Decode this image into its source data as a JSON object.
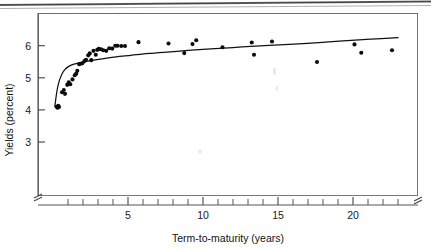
{
  "figure": {
    "alt_title": "Yields versus term-to-maturity scatter plot with fitted curve"
  },
  "chart_data": {
    "type": "scatter",
    "title": "",
    "xlabel": "Term-to-maturity (years)",
    "ylabel": "Yields (percent)",
    "xlim": [
      0,
      23.2
    ],
    "ylim": [
      2.55,
      6.55
    ],
    "xticks": [
      5,
      10,
      15,
      20
    ],
    "xtick_labels": [
      "5",
      "10",
      "15",
      "20"
    ],
    "x_minor_tick_step": 1,
    "yticks": [
      3,
      4,
      5,
      6
    ],
    "ytick_labels": [
      "3",
      "4",
      "5",
      "6"
    ],
    "grid": false,
    "legend": null,
    "axis_break_x": true,
    "axis_break_y": true,
    "series": [
      {
        "name": "Observed yields",
        "type": "scatter",
        "marker": "filled-circle",
        "color": "#0b0b0b",
        "points": [
          [
            0.25,
            4.1
          ],
          [
            0.3,
            4.07
          ],
          [
            0.35,
            4.13
          ],
          [
            0.4,
            4.09
          ],
          [
            0.6,
            4.55
          ],
          [
            0.72,
            4.62
          ],
          [
            0.8,
            4.5
          ],
          [
            0.95,
            4.78
          ],
          [
            1.05,
            4.86
          ],
          [
            1.15,
            4.8
          ],
          [
            1.3,
            4.95
          ],
          [
            1.45,
            5.08
          ],
          [
            1.55,
            5.13
          ],
          [
            1.62,
            5.22
          ],
          [
            1.75,
            5.42
          ],
          [
            1.8,
            5.44
          ],
          [
            1.95,
            5.45
          ],
          [
            2.1,
            5.52
          ],
          [
            2.2,
            5.56
          ],
          [
            2.35,
            5.7
          ],
          [
            2.45,
            5.76
          ],
          [
            2.55,
            5.55
          ],
          [
            2.7,
            5.84
          ],
          [
            2.85,
            5.72
          ],
          [
            2.95,
            5.87
          ],
          [
            3.05,
            5.9
          ],
          [
            3.2,
            5.89
          ],
          [
            3.35,
            5.86
          ],
          [
            3.55,
            5.84
          ],
          [
            3.75,
            5.92
          ],
          [
            3.95,
            5.91
          ],
          [
            4.15,
            6.0
          ],
          [
            4.3,
            6.0
          ],
          [
            4.55,
            5.99
          ],
          [
            4.8,
            5.99
          ],
          [
            5.7,
            6.11
          ],
          [
            7.7,
            6.07
          ],
          [
            8.75,
            5.77
          ],
          [
            9.3,
            6.05
          ],
          [
            9.55,
            6.17
          ],
          [
            11.3,
            5.95
          ],
          [
            13.25,
            6.1
          ],
          [
            13.4,
            5.72
          ],
          [
            14.6,
            6.13
          ],
          [
            17.6,
            5.49
          ],
          [
            20.1,
            6.04
          ],
          [
            20.55,
            5.78
          ],
          [
            22.6,
            5.86
          ]
        ]
      },
      {
        "name": "Fitted yield curve",
        "type": "line",
        "color": "#121212",
        "description": "Logarithmic fit rising steeply from 4.1 percent near zero maturity to about 6.25 percent at 23 years",
        "points": [
          [
            0.12,
            4.1
          ],
          [
            0.18,
            4.32
          ],
          [
            0.25,
            4.55
          ],
          [
            0.33,
            4.75
          ],
          [
            0.45,
            4.95
          ],
          [
            0.6,
            5.12
          ],
          [
            0.8,
            5.26
          ],
          [
            1.0,
            5.34
          ],
          [
            1.3,
            5.41
          ],
          [
            1.6,
            5.45
          ],
          [
            1.9,
            5.48
          ],
          [
            2.3,
            5.52
          ],
          [
            2.8,
            5.56
          ],
          [
            3.4,
            5.6
          ],
          [
            4.2,
            5.65
          ],
          [
            5.2,
            5.7
          ],
          [
            6.4,
            5.76
          ],
          [
            7.8,
            5.81
          ],
          [
            9.2,
            5.86
          ],
          [
            10.8,
            5.91
          ],
          [
            12.6,
            5.96
          ],
          [
            14.4,
            6.01
          ],
          [
            16.4,
            6.06
          ],
          [
            18.4,
            6.12
          ],
          [
            20.4,
            6.18
          ],
          [
            22.2,
            6.23
          ],
          [
            23.0,
            6.25
          ]
        ]
      }
    ]
  }
}
